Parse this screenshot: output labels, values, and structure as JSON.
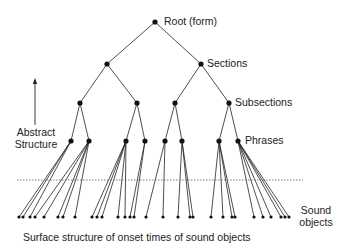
{
  "labels": {
    "root": "Root (form)",
    "sections": "Sections",
    "subsections": "Subsections",
    "phrases": "Phrases",
    "abstract_line1": "Abstract",
    "abstract_line2": "Structure",
    "sound_line1": "Sound",
    "sound_line2": "objects",
    "caption": "Surface structure of onset times of sound objects"
  },
  "colors": {
    "line": "#222222",
    "node": "#111111",
    "dotted": "#555555"
  },
  "tree": {
    "root": [
      155,
      22
    ],
    "sections": [
      [
        107,
        64
      ],
      [
        201,
        64
      ]
    ],
    "subsections": [
      [
        80,
        103
      ],
      [
        137,
        103
      ],
      [
        175,
        103
      ],
      [
        229,
        103
      ]
    ],
    "subsection_parent": [
      0,
      0,
      1,
      1
    ],
    "phrases": [
      [
        71,
        141
      ],
      [
        89,
        141
      ],
      [
        126,
        141
      ],
      [
        145,
        141
      ],
      [
        165,
        141
      ],
      [
        182,
        141
      ],
      [
        219,
        141
      ],
      [
        238,
        141
      ]
    ],
    "phrase_parent": [
      0,
      0,
      1,
      1,
      2,
      2,
      3,
      3
    ],
    "leaf_y": 217,
    "leaves": [
      {
        "phrase": 0,
        "x": [
          19,
          23,
          30
        ]
      },
      {
        "phrase": 1,
        "x": [
          35,
          44,
          58,
          63,
          75
        ]
      },
      {
        "phrase": 2,
        "x": [
          92,
          97,
          102,
          118,
          125
        ]
      },
      {
        "phrase": 3,
        "x": [
          130,
          134
        ]
      },
      {
        "phrase": 4,
        "x": [
          146,
          163
        ]
      },
      {
        "phrase": 5,
        "x": [
          178,
          190,
          193
        ]
      },
      {
        "phrase": 6,
        "x": [
          211,
          223,
          232,
          235
        ]
      },
      {
        "phrase": 7,
        "x": [
          254,
          263,
          271,
          281,
          285,
          289
        ]
      }
    ],
    "dotted_line": {
      "x1": 17,
      "x2": 303,
      "y": 180
    },
    "arrow": {
      "x": 35,
      "y1": 125,
      "y2": 78
    }
  }
}
